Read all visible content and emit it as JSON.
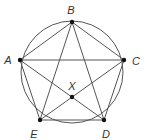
{
  "diagram": {
    "type": "geometry",
    "colors": {
      "stroke": "#555555",
      "point": "#111111",
      "label": "#333333",
      "background": "#ffffff"
    },
    "circle": {
      "cx": 72,
      "cy": 72,
      "r": 51
    },
    "points": [
      {
        "id": "B",
        "x": 72,
        "y": 22,
        "label": "B",
        "lx": 71,
        "ly": 10
      },
      {
        "id": "A",
        "x": 20,
        "y": 60,
        "label": "A",
        "lx": 8,
        "ly": 60
      },
      {
        "id": "C",
        "x": 124,
        "y": 60,
        "label": "C",
        "lx": 136,
        "ly": 61
      },
      {
        "id": "X",
        "x": 72,
        "y": 97,
        "label": "X",
        "lx": 72,
        "ly": 86
      },
      {
        "id": "E",
        "x": 40,
        "y": 120,
        "label": "E",
        "lx": 34,
        "ly": 134
      },
      {
        "id": "D",
        "x": 104,
        "y": 120,
        "label": "D",
        "lx": 106,
        "ly": 134
      }
    ],
    "segments": [
      {
        "from": "A",
        "to": "B"
      },
      {
        "from": "B",
        "to": "C"
      },
      {
        "from": "C",
        "to": "D"
      },
      {
        "from": "D",
        "to": "E"
      },
      {
        "from": "E",
        "to": "A"
      },
      {
        "from": "A",
        "to": "C"
      },
      {
        "from": "A",
        "to": "D"
      },
      {
        "from": "B",
        "to": "D"
      },
      {
        "from": "B",
        "to": "E"
      },
      {
        "from": "C",
        "to": "E"
      }
    ]
  }
}
